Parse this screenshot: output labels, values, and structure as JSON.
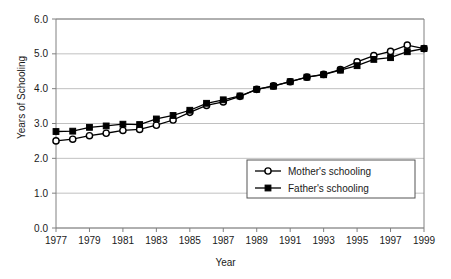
{
  "chart_data": {
    "type": "line",
    "title": "",
    "xlabel": "Year",
    "ylabel": "Years of Schooling",
    "xlim": [
      1977,
      1999
    ],
    "ylim": [
      0.0,
      6.0
    ],
    "grid": true,
    "legend_position": "center-right-inside",
    "x": [
      1977,
      1978,
      1979,
      1980,
      1981,
      1982,
      1983,
      1984,
      1985,
      1986,
      1987,
      1988,
      1989,
      1990,
      1991,
      1992,
      1993,
      1994,
      1995,
      1996,
      1997,
      1998,
      1999
    ],
    "xticks": [
      "1977",
      "1979",
      "1981",
      "1983",
      "1985",
      "1987",
      "1989",
      "1991",
      "1993",
      "1995",
      "1997",
      "1999"
    ],
    "xtick_values": [
      1977,
      1979,
      1981,
      1983,
      1985,
      1987,
      1989,
      1991,
      1993,
      1995,
      1997,
      1999
    ],
    "yticks": [
      "0.0",
      "1.0",
      "2.0",
      "3.0",
      "4.0",
      "5.0",
      "6.0"
    ],
    "ytick_values": [
      0.0,
      1.0,
      2.0,
      3.0,
      4.0,
      5.0,
      6.0
    ],
    "series": [
      {
        "name": "Mother's schooling",
        "marker": "open-circle",
        "color": "#000000",
        "values": [
          2.5,
          2.55,
          2.65,
          2.72,
          2.8,
          2.83,
          2.95,
          3.1,
          3.32,
          3.52,
          3.62,
          3.78,
          3.98,
          4.08,
          4.2,
          4.33,
          4.41,
          4.55,
          4.77,
          4.95,
          5.07,
          5.25,
          5.15
        ]
      },
      {
        "name": "Father's schooling",
        "marker": "filled-square",
        "color": "#000000",
        "values": [
          2.77,
          2.78,
          2.89,
          2.93,
          2.98,
          2.97,
          3.13,
          3.23,
          3.38,
          3.58,
          3.68,
          3.79,
          3.98,
          4.07,
          4.2,
          4.33,
          4.4,
          4.53,
          4.66,
          4.84,
          4.89,
          5.06,
          5.15
        ]
      }
    ]
  },
  "legend": {
    "items": [
      {
        "label": "Mother's schooling",
        "marker": "open-circle"
      },
      {
        "label": "Father's schooling",
        "marker": "filled-square"
      }
    ]
  }
}
